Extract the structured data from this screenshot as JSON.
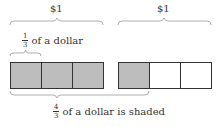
{
  "colors": {
    "shaded": "#bdbdbd",
    "unshaded": "#ffffff",
    "stroke": "#333333",
    "brace": "#999999"
  },
  "bars": [
    {
      "label": "$1",
      "cells": [
        {
          "shaded": true
        },
        {
          "shaded": true
        },
        {
          "shaded": true
        }
      ]
    },
    {
      "label": "$1",
      "cells": [
        {
          "shaded": true
        },
        {
          "shaded": false
        },
        {
          "shaded": false
        }
      ]
    }
  ],
  "labels": {
    "dollar_left": "$1",
    "dollar_right": "$1",
    "third": {
      "numerator": "1",
      "denominator": "3",
      "text": "of a dollar"
    },
    "shaded": {
      "numerator": "4",
      "denominator": "3",
      "text": "of a dollar is shaded"
    }
  }
}
